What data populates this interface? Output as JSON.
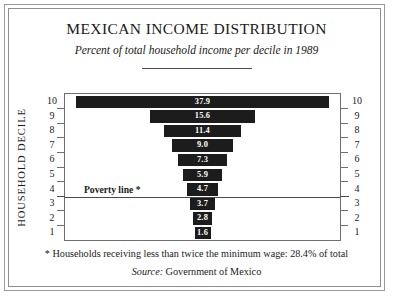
{
  "chart_data": {
    "type": "bar",
    "orientation": "horizontal-centered-funnel",
    "title": "MEXICAN INCOME DISTRIBUTION",
    "subtitle": "Percent of total household income per decile in 1989",
    "ylabel": "HOUSEHOLD DECILE",
    "xlabel": "",
    "categories": [
      "10",
      "9",
      "8",
      "7",
      "6",
      "5",
      "4",
      "3",
      "2",
      "1"
    ],
    "values": [
      37.9,
      15.6,
      11.4,
      9.0,
      7.3,
      5.9,
      4.7,
      3.7,
      2.8,
      1.6
    ],
    "value_labels": [
      "37.9",
      "15.6",
      "11.4",
      "9.0",
      "7.3",
      "5.9",
      "4.7",
      "3.7",
      "2.8",
      "1.6"
    ],
    "xlim": [
      0,
      41.2
    ],
    "grid": false,
    "legend": null,
    "bar_color": "#1c1c1c",
    "value_label_color": "#ffffff",
    "annotations": [
      {
        "name": "poverty-line",
        "label": "Poverty line *",
        "between_categories": [
          "4",
          "3"
        ]
      }
    ],
    "footnote": "* Households receiving less than twice the minimum wage:  28.4% of total",
    "source_label": "Source:",
    "source_value": "Government of Mexico"
  },
  "axis": {
    "left_ticks": [
      "10",
      "9",
      "8",
      "7",
      "6",
      "5",
      "4",
      "3",
      "2",
      "1"
    ],
    "right_ticks": [
      "10",
      "9",
      "8",
      "7",
      "6",
      "5",
      "4",
      "3",
      "2",
      "1"
    ]
  }
}
